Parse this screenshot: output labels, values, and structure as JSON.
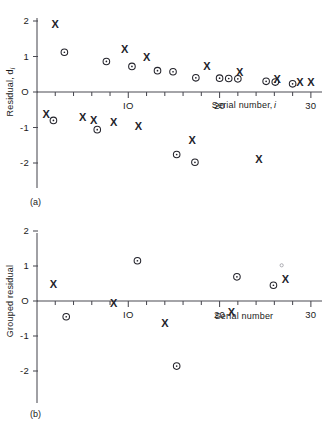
{
  "figure": {
    "caption_a": "(a)",
    "caption_b": "(b)"
  },
  "chart_data": [
    {
      "type": "scatter",
      "panel": "(a)",
      "title": "",
      "xlabel": "Serial number, i",
      "ylabel": "Residual, d",
      "ylabel_sub": "i",
      "xlim": [
        0,
        31
      ],
      "ylim": [
        -2.45,
        2.35
      ],
      "xticks": [
        2,
        4,
        6,
        8,
        10,
        12,
        14,
        16,
        18,
        20,
        22,
        24,
        26,
        28,
        30
      ],
      "xtick_labels": [
        "",
        "",
        "",
        "",
        "IO",
        "",
        "",
        "",
        "",
        "20",
        "",
        "",
        "",
        "",
        "30"
      ],
      "yticks": [
        2,
        1,
        0,
        -1,
        -2
      ],
      "ytick_labels": [
        "2",
        "1",
        "O",
        "-1",
        "-2"
      ],
      "grid": false,
      "legend": "none",
      "series": [
        {
          "name": "x-marker residual",
          "marker": "x",
          "points": [
            {
              "x": 2.0,
              "y": 1.92
            },
            {
              "x": 1.0,
              "y": -0.62
            },
            {
              "x": 5.0,
              "y": -0.7
            },
            {
              "x": 6.2,
              "y": -0.78
            },
            {
              "x": 8.4,
              "y": -0.84
            },
            {
              "x": 9.6,
              "y": 1.22
            },
            {
              "x": 11.1,
              "y": -0.97
            },
            {
              "x": 12.0,
              "y": 1.0
            },
            {
              "x": 17.0,
              "y": -1.36
            },
            {
              "x": 18.6,
              "y": 0.74
            },
            {
              "x": 22.2,
              "y": 0.55
            },
            {
              "x": 24.3,
              "y": -1.9
            },
            {
              "x": 26.3,
              "y": 0.37
            },
            {
              "x": 28.8,
              "y": 0.28
            },
            {
              "x": 30.0,
              "y": 0.28
            }
          ]
        },
        {
          "name": "circle-marker residual",
          "marker": "o",
          "points": [
            {
              "x": 3.0,
              "y": 1.12
            },
            {
              "x": 1.8,
              "y": -0.8
            },
            {
              "x": 6.6,
              "y": -1.06
            },
            {
              "x": 7.6,
              "y": 0.86
            },
            {
              "x": 10.4,
              "y": 0.72
            },
            {
              "x": 13.2,
              "y": 0.6
            },
            {
              "x": 14.9,
              "y": 0.57
            },
            {
              "x": 15.3,
              "y": -1.76
            },
            {
              "x": 17.3,
              "y": -1.98
            },
            {
              "x": 17.4,
              "y": 0.4
            },
            {
              "x": 20.0,
              "y": 0.39
            },
            {
              "x": 21.0,
              "y": 0.38
            },
            {
              "x": 22.0,
              "y": 0.37
            },
            {
              "x": 25.1,
              "y": 0.3
            },
            {
              "x": 26.1,
              "y": 0.28
            },
            {
              "x": 28.0,
              "y": 0.23
            }
          ]
        }
      ]
    },
    {
      "type": "scatter",
      "panel": "(b)",
      "title": "",
      "xlabel": "Serial number",
      "ylabel": "Grouped residual",
      "xlim": [
        0,
        31
      ],
      "ylim": [
        -2.45,
        2.35
      ],
      "xticks": [
        2,
        4,
        6,
        8,
        10,
        12,
        14,
        16,
        18,
        20,
        22,
        24,
        26,
        28,
        30
      ],
      "xtick_labels": [
        "",
        "",
        "",
        "",
        "IO",
        "",
        "",
        "",
        "",
        "20",
        "",
        "",
        "",
        "",
        "30"
      ],
      "yticks": [
        2,
        1,
        0,
        -1,
        -2
      ],
      "ytick_labels": [
        "2",
        "1",
        "O",
        "-1",
        "-2"
      ],
      "grid": false,
      "legend": "none",
      "series": [
        {
          "name": "x-marker grouped residual",
          "marker": "x",
          "points": [
            {
              "x": 1.8,
              "y": 0.5
            },
            {
              "x": 8.4,
              "y": -0.07
            },
            {
              "x": 14.0,
              "y": -0.64
            },
            {
              "x": 21.3,
              "y": -0.32
            },
            {
              "x": 27.2,
              "y": 0.62
            }
          ]
        },
        {
          "name": "circle-marker grouped residual",
          "marker": "o",
          "points": [
            {
              "x": 3.2,
              "y": -0.45
            },
            {
              "x": 11.0,
              "y": 1.15
            },
            {
              "x": 15.3,
              "y": -1.86
            },
            {
              "x": 21.9,
              "y": 0.69
            },
            {
              "x": 25.9,
              "y": 0.45
            }
          ]
        },
        {
          "name": "faint-speck",
          "marker": "faint",
          "points": [
            {
              "x": 26.8,
              "y": 1.02
            }
          ]
        }
      ]
    }
  ]
}
